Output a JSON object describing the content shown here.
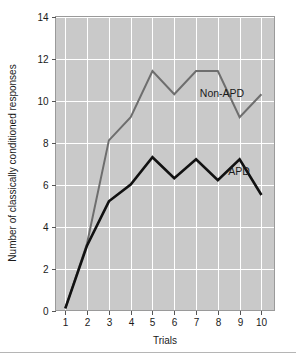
{
  "chart_data": {
    "type": "line",
    "title": "",
    "xlabel": "Trials",
    "ylabel": "Number of classically conditioned responses",
    "x": [
      1,
      2,
      3,
      4,
      5,
      6,
      7,
      8,
      9,
      10
    ],
    "xtick_labels": [
      "1",
      "2",
      "3",
      "4",
      "5",
      "6",
      "7",
      "8",
      "9",
      "10"
    ],
    "ytick_labels": [
      "0",
      "2",
      "4",
      "6",
      "8",
      "10",
      "12",
      "14"
    ],
    "yticks": [
      0,
      2,
      4,
      6,
      8,
      10,
      12,
      14
    ],
    "xlim": [
      0.55,
      10.6
    ],
    "ylim": [
      0,
      14
    ],
    "grid": true,
    "legend_position": "inline-annotations",
    "series": [
      {
        "name": "Non-APD",
        "color": "#6e6e6e",
        "line_width": 2.0,
        "values": [
          0.1,
          3.2,
          8.1,
          9.2,
          11.4,
          10.3,
          11.4,
          11.4,
          9.2,
          10.3
        ]
      },
      {
        "name": "APD",
        "color": "#111111",
        "line_width": 2.6,
        "values": [
          0.1,
          3.1,
          5.2,
          6.0,
          7.3,
          6.3,
          7.2,
          6.2,
          7.2,
          5.5
        ]
      }
    ],
    "annotations": [
      {
        "text": "Non-APD",
        "x_px": 222,
        "y_px": 97
      },
      {
        "text": "APD",
        "x_px": 239,
        "y_px": 175
      }
    ],
    "plot_background": "#c9c9c9",
    "gridline_color": "#ffffff",
    "figure_background": "#ffffff"
  }
}
